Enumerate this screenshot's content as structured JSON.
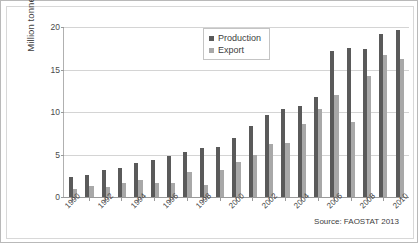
{
  "chart_data": {
    "type": "bar",
    "title": "",
    "xlabel": "",
    "ylabel": "Million tonnes",
    "ylim": [
      0,
      20
    ],
    "yticks": [
      0,
      5,
      10,
      15,
      20
    ],
    "grid": true,
    "legend_position": "top-center",
    "source_note": "Source: FAOSTAT 2013",
    "categories": [
      "1990",
      "1991",
      "1992",
      "1993",
      "1994",
      "1995",
      "1996",
      "1997",
      "1998",
      "1999",
      "2000",
      "2001",
      "2002",
      "2003",
      "2004",
      "2005",
      "2006",
      "2007",
      "2008",
      "2009",
      "2010"
    ],
    "tick_labels": [
      "1990",
      "",
      "1992",
      "",
      "1994",
      "",
      "1996",
      "",
      "1998",
      "",
      "2000",
      "",
      "2002",
      "",
      "2004",
      "",
      "2006",
      "",
      "2008",
      "",
      "2010"
    ],
    "series": [
      {
        "name": "Production",
        "color": "#5a5a5a",
        "values": [
          2.3,
          2.6,
          3.2,
          3.4,
          4.0,
          4.4,
          4.8,
          5.3,
          5.8,
          5.9,
          6.9,
          8.3,
          9.6,
          10.4,
          10.7,
          11.8,
          17.2,
          17.5,
          17.4,
          19.2,
          19.7
        ]
      },
      {
        "name": "Export",
        "color": "#a8a8a8",
        "values": [
          1.0,
          1.3,
          1.2,
          1.6,
          2.0,
          1.6,
          1.6,
          2.9,
          1.4,
          3.2,
          4.1,
          4.9,
          6.2,
          6.3,
          8.6,
          10.3,
          12.0,
          8.8,
          14.2,
          16.7,
          16.2
        ]
      }
    ]
  }
}
